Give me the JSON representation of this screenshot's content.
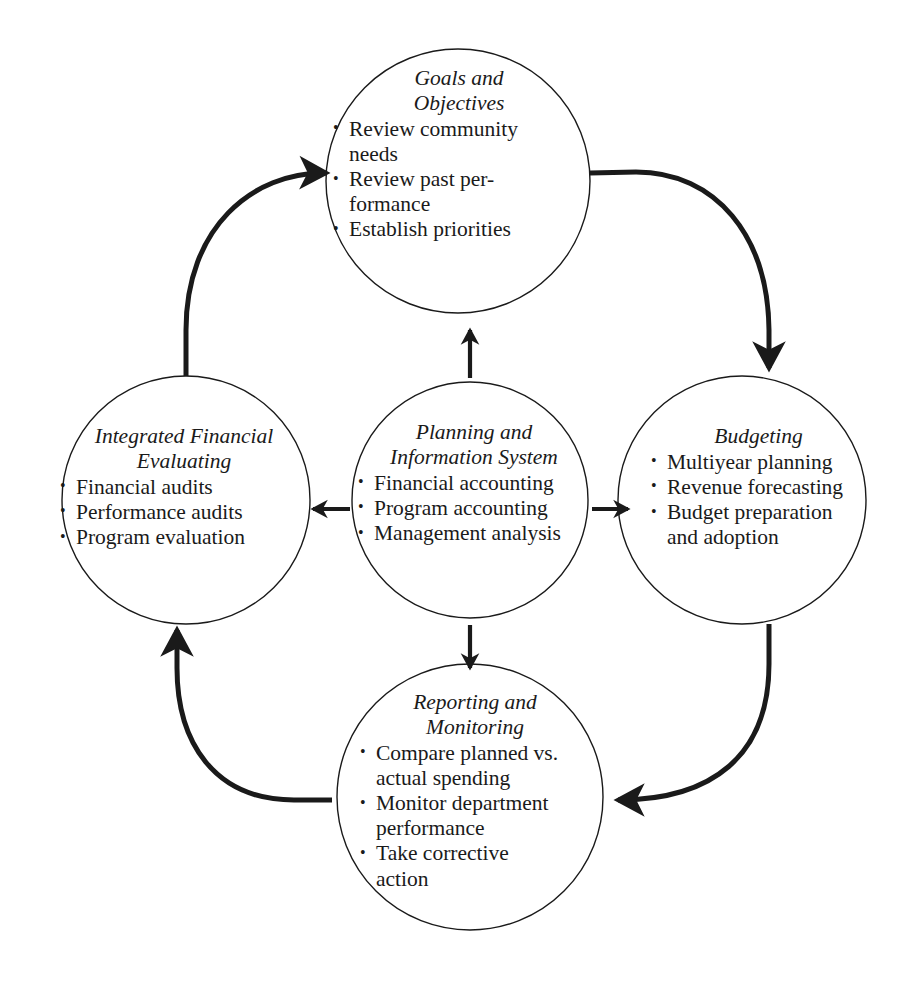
{
  "diagram": {
    "type": "cycle-diagram",
    "style": {
      "background": "#ffffff",
      "stroke": "#1a1a1a",
      "circle_stroke_width": 1.4,
      "arc_stroke_width": 5
    },
    "nodes": [
      {
        "id": "goals",
        "title": "Goals and\nObjectives",
        "items": [
          "Review community\nneeds",
          "Review past per-\nformance",
          "Establish priorities"
        ]
      },
      {
        "id": "budgeting",
        "title": "Budgeting",
        "items": [
          "Multiyear planning",
          "Revenue forecasting",
          "Budget preparation\nand adoption"
        ]
      },
      {
        "id": "reporting",
        "title": "Reporting and\nMonitoring",
        "items": [
          "Compare planned vs.\nactual spending",
          "Monitor department\nperformance",
          "Take corrective\naction"
        ]
      },
      {
        "id": "evaluating",
        "title": "Integrated Financial\nEvaluating",
        "items": [
          "Financial audits",
          "Performance audits",
          "Program evaluation"
        ]
      },
      {
        "id": "planning",
        "title": "Planning and\nInformation System",
        "items": [
          "Financial accounting",
          "Program accounting",
          "Management analysis"
        ]
      }
    ],
    "connectors": {
      "outer_cycle": [
        {
          "from": "evaluating",
          "to": "goals",
          "direction": "clockwise"
        },
        {
          "from": "goals",
          "to": "budgeting",
          "direction": "clockwise"
        },
        {
          "from": "budgeting",
          "to": "reporting",
          "direction": "clockwise"
        },
        {
          "from": "reporting",
          "to": "evaluating",
          "direction": "clockwise"
        }
      ],
      "inner_spokes": [
        {
          "from": "planning",
          "to": "goals",
          "direction": "up"
        },
        {
          "from": "planning",
          "to": "budgeting",
          "direction": "right"
        },
        {
          "from": "planning",
          "to": "reporting",
          "direction": "down"
        },
        {
          "from": "planning",
          "to": "evaluating",
          "direction": "left"
        }
      ]
    },
    "bullet_glyph": "•"
  }
}
